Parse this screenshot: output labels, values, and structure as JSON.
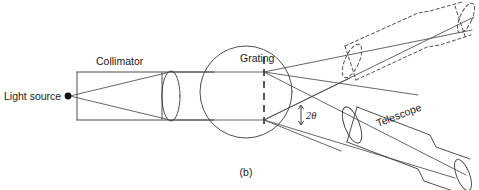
{
  "figure": {
    "caption": "(b)",
    "background_color": "#ffffff",
    "line_color": "#3a3a3a",
    "width": 479,
    "height": 190
  },
  "labels": {
    "light_source": "Light source",
    "collimator": "Collimator",
    "grating": "Grating",
    "telescope": "Telescope",
    "angle": "2θ"
  },
  "diagram_data": {
    "type": "optical-ray-diagram",
    "title": "Grating spectrometer (b)",
    "components": [
      {
        "name": "light-source",
        "kind": "point-source",
        "position": [
          68,
          96
        ],
        "label": "Light source"
      },
      {
        "name": "collimator-tube",
        "kind": "tube",
        "label": "Collimator",
        "top_y": 72,
        "bottom_y": 120,
        "left_x": 77,
        "right_x": 214
      },
      {
        "name": "collimator-lens",
        "kind": "lens-ellipse",
        "center": [
          171,
          96
        ],
        "rx": 9,
        "ry": 25
      },
      {
        "name": "grating-stage",
        "kind": "circle",
        "center": [
          246,
          92
        ],
        "radius": 46,
        "label": "Grating"
      },
      {
        "name": "grating-line",
        "kind": "dashed-vertical-line",
        "x": 264,
        "y_top": 57,
        "y_bottom": 125
      },
      {
        "name": "telescope-lower",
        "kind": "tube-rotated",
        "label": "Telescope",
        "state": "solid",
        "axis_angle_deg": -21,
        "objective_center": [
          359,
          127
        ],
        "eyepiece_center": [
          464,
          166
        ]
      },
      {
        "name": "telescope-upper",
        "kind": "tube-rotated",
        "state": "dashed",
        "axis_angle_deg": 24,
        "objective_center": [
          356,
          58
        ],
        "eyepiece_center": [
          461,
          15
        ]
      }
    ],
    "rays": {
      "source_fan": "diverging from light source to collimator lens",
      "collimated_beam": "parallel beam from collimator lens to grating",
      "diffracted_upper": "fan toward upper (dashed) telescope",
      "diffracted_lower": "fan toward lower (solid) telescope"
    },
    "annotation": {
      "name": "angle-2theta",
      "text": "2θ",
      "marker": "double-headed-arrow",
      "position": [
        310,
        114
      ]
    }
  }
}
